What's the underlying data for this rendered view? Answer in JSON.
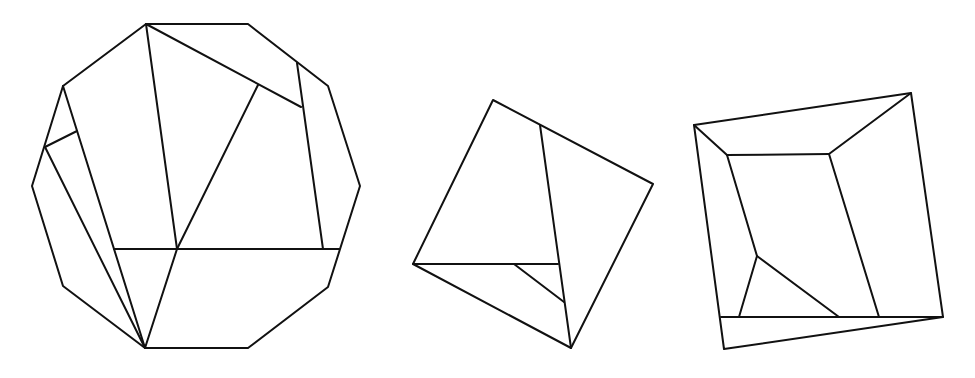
{
  "diagram": {
    "stroke_color": "#111111",
    "stroke_width": 2,
    "background": "#ffffff",
    "shapes": [
      {
        "name": "decagon-dissection",
        "outline": [
          [
            146,
            24
          ],
          [
            248,
            24
          ],
          [
            328,
            86
          ],
          [
            360,
            186
          ],
          [
            328,
            287
          ],
          [
            248,
            348
          ],
          [
            145,
            348
          ],
          [
            63,
            286
          ],
          [
            32,
            186
          ],
          [
            63,
            86
          ]
        ],
        "segments": [
          [
            [
              146,
              24
            ],
            [
              177,
              249
            ]
          ],
          [
            [
              146,
              24
            ],
            [
              301,
              107
            ]
          ],
          [
            [
              297,
              63
            ],
            [
              323,
              249
            ]
          ],
          [
            [
              258,
              85
            ],
            [
              177,
              249
            ]
          ],
          [
            [
              114,
              249
            ],
            [
              339,
              249
            ]
          ],
          [
            [
              177,
              249
            ],
            [
              145,
              348
            ]
          ],
          [
            [
              63,
              86
            ],
            [
              145,
              348
            ]
          ],
          [
            [
              77,
              131
            ],
            [
              45,
              147
            ]
          ],
          [
            [
              45,
              147
            ],
            [
              145,
              348
            ]
          ]
        ]
      },
      {
        "name": "square-dissection",
        "outline": [
          [
            493,
            100
          ],
          [
            653,
            184
          ],
          [
            571,
            348
          ],
          [
            413,
            264
          ]
        ],
        "segments": [
          [
            [
              540,
              125
            ],
            [
              571,
              348
            ]
          ],
          [
            [
              413,
              264
            ],
            [
              558,
              264
            ]
          ],
          [
            [
              514,
              264
            ],
            [
              564,
              302
            ]
          ]
        ]
      },
      {
        "name": "quadrilateral-dissection",
        "outline": [
          [
            694,
            125
          ],
          [
            911,
            93
          ],
          [
            943,
            317
          ],
          [
            724,
            349
          ]
        ],
        "segments": [
          [
            [
              694,
              125
            ],
            [
              727,
              155
            ]
          ],
          [
            [
              911,
              93
            ],
            [
              829,
              154
            ]
          ],
          [
            [
              727,
              155
            ],
            [
              829,
              154
            ]
          ],
          [
            [
              727,
              155
            ],
            [
              757,
              256
            ]
          ],
          [
            [
              829,
              154
            ],
            [
              879,
              317
            ]
          ],
          [
            [
              757,
              256
            ],
            [
              739,
              317
            ]
          ],
          [
            [
              757,
              256
            ],
            [
              839,
              317
            ]
          ],
          [
            [
              721,
              317
            ],
            [
              943,
              317
            ]
          ]
        ]
      }
    ]
  }
}
